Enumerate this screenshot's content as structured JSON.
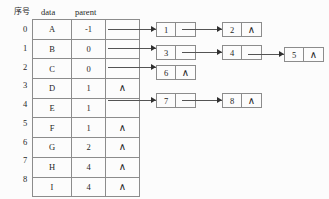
{
  "figure": {
    "background_color": "#fcfcfc",
    "line_color": "#545454",
    "text_color": "#1f1f1f"
  },
  "table": {
    "headers": {
      "index": "序号",
      "data": "data",
      "parent": "parent"
    },
    "rows": [
      {
        "index": "0",
        "data": "A",
        "parent": "-1",
        "link": "arrow"
      },
      {
        "index": "1",
        "data": "B",
        "parent": "0",
        "link": "arrow"
      },
      {
        "index": "2",
        "data": "C",
        "parent": "0",
        "link": "arrow"
      },
      {
        "index": "3",
        "data": "D",
        "parent": "1",
        "link": "null"
      },
      {
        "index": "4",
        "data": "E",
        "parent": "1",
        "link": "arrow"
      },
      {
        "index": "5",
        "data": "F",
        "parent": "1",
        "link": "null"
      },
      {
        "index": "6",
        "data": "G",
        "parent": "2",
        "link": "null"
      },
      {
        "index": "7",
        "data": "H",
        "parent": "4",
        "link": "null"
      },
      {
        "index": "8",
        "data": "I",
        "parent": "4",
        "link": "null"
      }
    ]
  },
  "null_glyph": "∧",
  "lists": [
    {
      "name": "children-of-0",
      "nodes": [
        {
          "value": "1",
          "next": "pointer"
        },
        {
          "value": "2",
          "next": "null"
        }
      ]
    },
    {
      "name": "children-of-1",
      "nodes": [
        {
          "value": "3",
          "next": "pointer"
        },
        {
          "value": "4",
          "next": "pointer"
        },
        {
          "value": "5",
          "next": "null"
        }
      ]
    },
    {
      "name": "children-of-2",
      "nodes": [
        {
          "value": "6",
          "next": "null"
        }
      ]
    },
    {
      "name": "children-of-4",
      "nodes": [
        {
          "value": "7",
          "next": "pointer"
        },
        {
          "value": "8",
          "next": "null"
        }
      ]
    }
  ],
  "nodes_flat": [
    {
      "id": "n1",
      "value": "1",
      "next": "pointer"
    },
    {
      "id": "n2",
      "value": "2",
      "next": "null"
    },
    {
      "id": "n3",
      "value": "3",
      "next": "pointer"
    },
    {
      "id": "n4",
      "value": "4",
      "next": "pointer"
    },
    {
      "id": "n5",
      "value": "5",
      "next": "null"
    },
    {
      "id": "n6",
      "value": "6",
      "next": "null"
    },
    {
      "id": "n7",
      "value": "7",
      "next": "pointer"
    },
    {
      "id": "n8",
      "value": "8",
      "next": "null"
    }
  ]
}
